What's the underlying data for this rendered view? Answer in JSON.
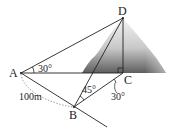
{
  "diagram": {
    "points": {
      "A": {
        "label": "A",
        "x": 21,
        "y": 73
      },
      "B": {
        "label": "B",
        "x": 74,
        "y": 107
      },
      "C": {
        "label": "C",
        "x": 123,
        "y": 73
      },
      "D": {
        "label": "D",
        "x": 123,
        "y": 18
      }
    },
    "angles": {
      "DAC": "30°",
      "DBC": "45°",
      "BCx": "30°"
    },
    "distance_AB": "100m",
    "colors": {
      "line": "#222222",
      "mountain_dark": "#5a5a5a",
      "mountain_light": "#f2f2f2"
    }
  }
}
